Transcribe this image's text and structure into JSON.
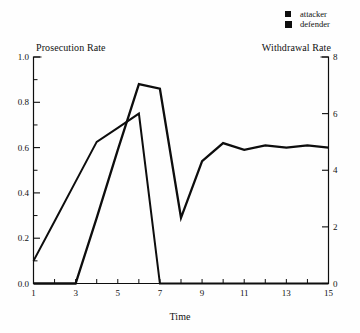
{
  "figure": {
    "left_axis_title": "Prosecution Rate",
    "right_axis_title": "Withdrawal Rate",
    "x_axis_title": "Time",
    "legend": [
      {
        "label": "attacker",
        "marker": "filled-square",
        "color": "#0d0d0d"
      },
      {
        "label": "defender",
        "marker": "filled-square",
        "color": "#0d0d0d"
      }
    ]
  },
  "chart_data": {
    "type": "line",
    "title": "",
    "grid": false,
    "legend_position": "top-right",
    "line_color": "#0d0d0d",
    "x": [
      1,
      2,
      3,
      4,
      5,
      6,
      7,
      8,
      9,
      10,
      11,
      12,
      13,
      14,
      15
    ],
    "x_axis": {
      "title": "Time",
      "min": 1,
      "max": 15,
      "ticks": [
        1,
        2,
        3,
        4,
        5,
        6,
        7,
        8,
        9,
        10,
        11,
        12,
        13,
        14,
        15
      ],
      "labeled_ticks": [
        1,
        3,
        5,
        7,
        9,
        11,
        13,
        15
      ],
      "tick_labels": [
        "1",
        "3",
        "5",
        "7",
        "9",
        "11",
        "13",
        "15"
      ]
    },
    "left_axis": {
      "title": "Prosecution Rate",
      "min": 0,
      "max": 1,
      "major_ticks": [
        0,
        0.2,
        0.4,
        0.6,
        0.8,
        1.0
      ],
      "minor_ticks": [
        0.1,
        0.3,
        0.5,
        0.7,
        0.9
      ],
      "tick_labels": [
        "0.0",
        "0.2",
        "0.4",
        "0.6",
        "0.8",
        "1.0"
      ]
    },
    "right_axis": {
      "title": "Withdrawal Rate",
      "min": 0,
      "max": 8,
      "major_ticks": [
        0,
        2,
        4,
        6,
        8
      ],
      "tick_labels": [
        "0",
        "2",
        "4",
        "6",
        "8"
      ]
    },
    "series": [
      {
        "name": "attacker",
        "measure": "Prosecution Rate",
        "axis": "left",
        "stroke_width": 2.3,
        "values": [
          0,
          0,
          0,
          0.29,
          0.59,
          0.88,
          0.86,
          0.29,
          0.54,
          0.62,
          0.59,
          0.61,
          0.6,
          0.61,
          0.6
        ]
      },
      {
        "name": "defender",
        "measure": "Withdrawal Rate",
        "axis": "right",
        "stroke_width": 2.0,
        "values": [
          0.8,
          2.2,
          3.6,
          5.0,
          5.5,
          6.0,
          0,
          0,
          0,
          0,
          0,
          0,
          0,
          0,
          0
        ]
      }
    ]
  }
}
